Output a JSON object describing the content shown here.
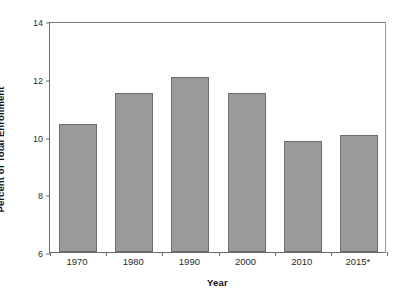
{
  "chart_data": {
    "type": "bar",
    "title": "",
    "subtitle": "",
    "xlabel": "Year",
    "ylabel": "Percent of Total Enrollment",
    "categories": [
      "1970",
      "1980",
      "1990",
      "2000",
      "2010",
      "2015*"
    ],
    "values": [
      10.45,
      11.5,
      12.05,
      11.5,
      9.85,
      10.05
    ],
    "series": [
      {
        "name": "Percent of Total Enrollment",
        "values": [
          10.45,
          11.5,
          12.05,
          11.5,
          9.85,
          10.05
        ]
      }
    ],
    "ylim": [
      6,
      14
    ],
    "xlim_categories": 6,
    "ytick_labels": [
      "6",
      "8",
      "10",
      "12",
      "14"
    ],
    "ytick_values": [
      6,
      8,
      10,
      12,
      14
    ],
    "grid": false,
    "legend": "none",
    "bar_color": "#9a9a9a",
    "bar_border_color": "#6e6e6e",
    "axis_color": "#6b6b6b",
    "background": "#ffffff",
    "annotations": []
  }
}
